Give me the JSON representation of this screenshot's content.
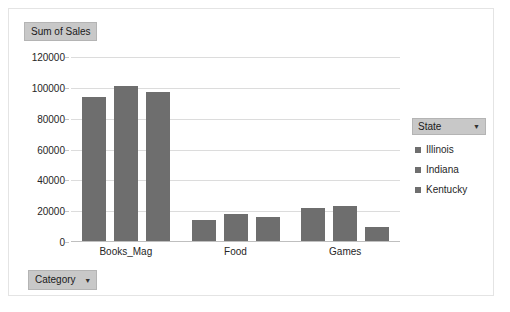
{
  "value_field_button": {
    "label": "Sum of Sales"
  },
  "category_field_button": {
    "label": "Category",
    "caret": "▼"
  },
  "legend": {
    "title": "State",
    "caret": "▼",
    "entries": [
      {
        "label": "Illinois",
        "color": "#6e6e6e"
      },
      {
        "label": "Indiana",
        "color": "#6e6e6e"
      },
      {
        "label": "Kentucky",
        "color": "#6e6e6e"
      }
    ]
  },
  "chart_data": {
    "type": "bar",
    "title": "Sum of Sales",
    "xlabel": "Category",
    "ylabel": "Sum of Sales",
    "categories": [
      "Books_Mag",
      "Food",
      "Games"
    ],
    "series": [
      {
        "name": "Illinois",
        "values": [
          94000,
          14000,
          22000
        ]
      },
      {
        "name": "Indiana",
        "values": [
          101000,
          18000,
          23500
        ]
      },
      {
        "name": "Kentucky",
        "values": [
          97000,
          16000,
          10000
        ]
      }
    ],
    "ylim": [
      0,
      120000
    ],
    "ytick_values": [
      0,
      20000,
      40000,
      60000,
      80000,
      100000,
      120000
    ],
    "ytick_labels": [
      "0",
      "20000",
      "40000",
      "60000",
      "80000",
      "100000",
      "120000"
    ],
    "grid": true,
    "legend_position": "right",
    "bar_color": "#6e6e6e"
  }
}
